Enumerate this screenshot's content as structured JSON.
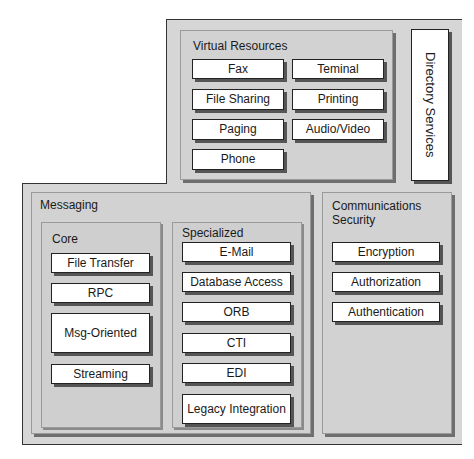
{
  "virtual_resources": {
    "title": "Virtual Resources",
    "items": [
      "Fax",
      "Teminal",
      "File Sharing",
      "Printing",
      "Paging",
      "Audio/Video",
      "Phone"
    ]
  },
  "directory_services": {
    "label": "Directory Services"
  },
  "messaging": {
    "title": "Messaging",
    "core": {
      "title": "Core",
      "items": [
        "File Transfer",
        "RPC",
        "Msg-Oriented",
        "Streaming"
      ]
    },
    "specialized": {
      "title": "Specialized",
      "items": [
        "E-Mail",
        "Database Access",
        "ORB",
        "CTI",
        "EDI",
        "Legacy Integration"
      ]
    }
  },
  "communications_security": {
    "title": "Communications Security",
    "items": [
      "Encryption",
      "Authorization",
      "Authentication"
    ]
  }
}
